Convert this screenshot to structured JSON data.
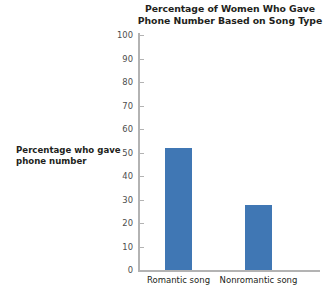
{
  "chart_data": {
    "type": "bar",
    "title": "Percentage of Women Who Gave\nPhone Number Based on Song Type",
    "categories": [
      "Romantic song",
      "Nonromantic song"
    ],
    "values": [
      52,
      27.5
    ],
    "xlabel": "",
    "ylabel": "Percentage who gave\nphone number",
    "ylim": [
      0,
      100
    ],
    "ytick_labels": [
      "100",
      "90",
      "80",
      "70",
      "60",
      "50",
      "40",
      "30",
      "20",
      "10",
      "0"
    ],
    "ytick_values": [
      100,
      90,
      80,
      70,
      60,
      50,
      40,
      30,
      20,
      10,
      0
    ],
    "grid": false,
    "legend": false,
    "bar_color": "#4077b4",
    "axis_color": "#b3b3b3",
    "text_color": "#231f20"
  }
}
